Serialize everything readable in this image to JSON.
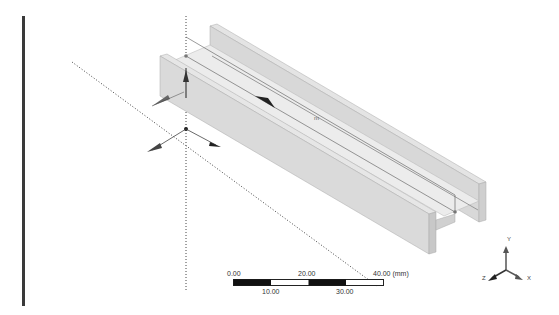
{
  "viewport": {
    "name": "3D geometry viewport",
    "model": "I-beam / channel extrusion",
    "center_mark": "m"
  },
  "scale_bar": {
    "unit": "(mm)",
    "top_labels": [
      "0.00",
      "20.00",
      "40.00"
    ],
    "bottom_labels": [
      "10.00",
      "30.00"
    ],
    "unit_suffix": "40.00 (mm)"
  },
  "triad": {
    "x_label": "X",
    "y_label": "Y",
    "z_label": "Z"
  },
  "colors": {
    "beam_face": "#dcdcdc",
    "beam_light": "#ececec",
    "beam_dark": "#bdbdbd",
    "axis_line": "#333333"
  }
}
